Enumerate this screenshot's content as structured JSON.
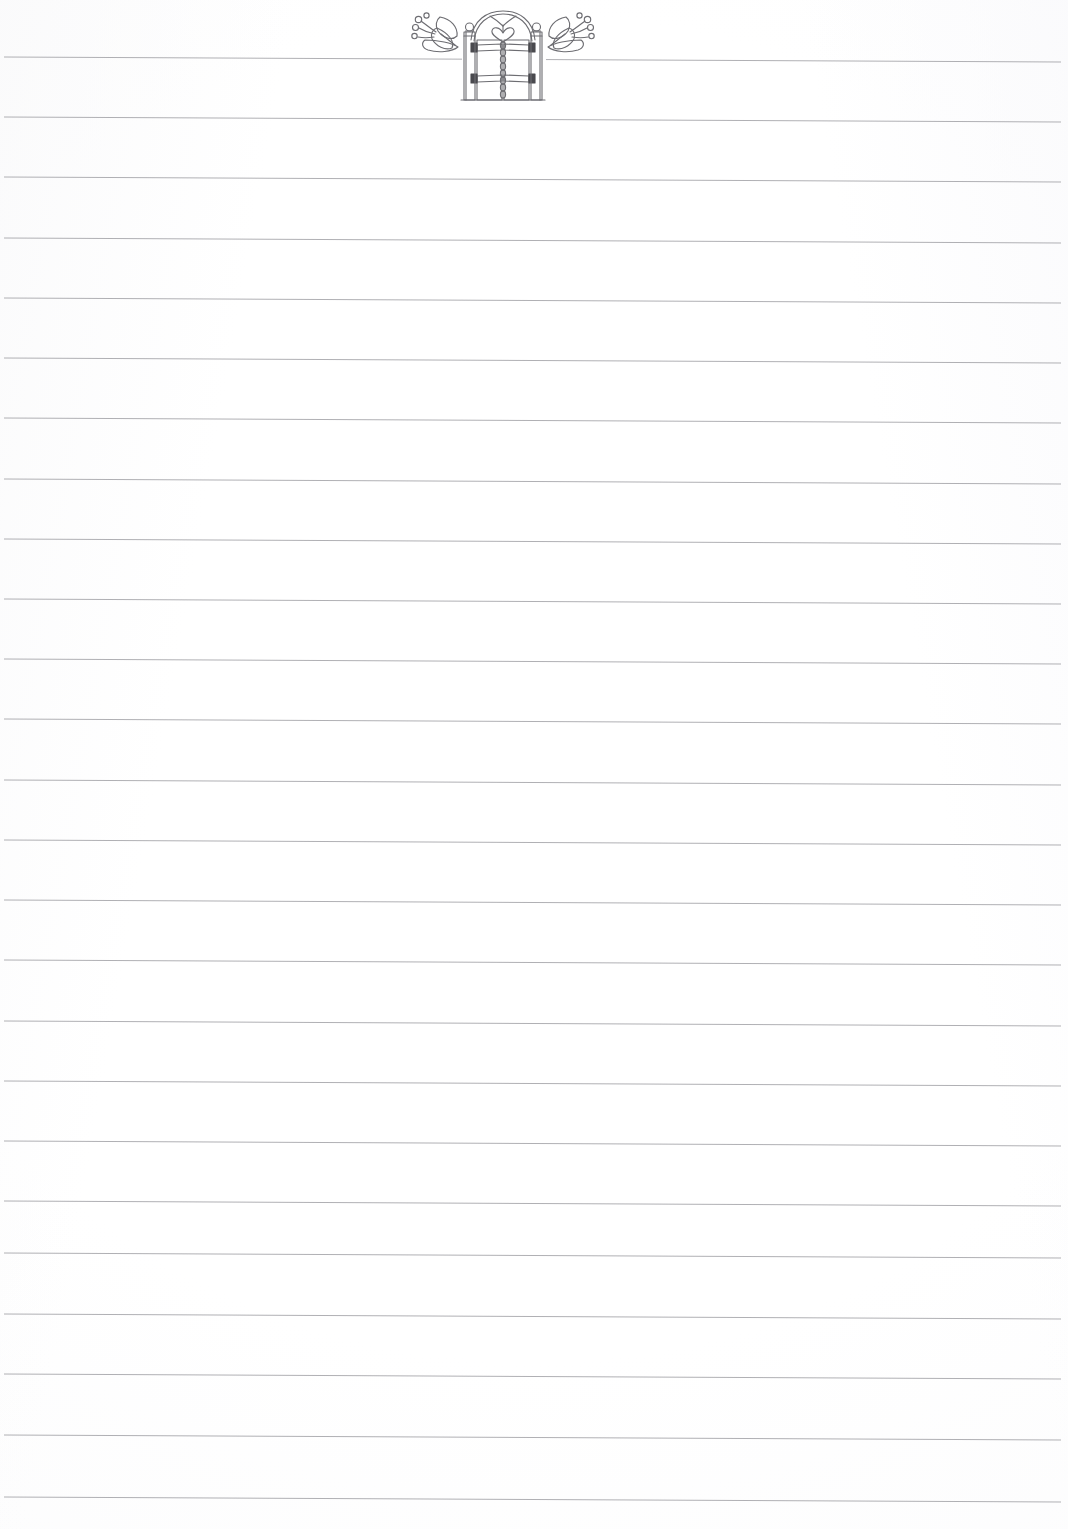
{
  "page": {
    "kind": "lined-notepaper-sheet",
    "width_px": 1068,
    "height_px": 1529,
    "background_color": "#fefefe",
    "paper_tint": "#fbfbfc",
    "content_text": "",
    "written_content": "",
    "notes_written": ""
  },
  "rules": {
    "label": "ruled writing lines",
    "line_color": "#9a9a9f",
    "line_width_px": 1,
    "count": 25,
    "first_line_y": 57,
    "spacing_y": 60.2,
    "left_margin_x": 4,
    "right_margin_x": 1061,
    "slope_drop_px": 5,
    "interrupted_first_line": true,
    "gap_start_x": 462,
    "gap_end_x": 546,
    "line_y_positions": [
      57,
      117,
      177,
      238,
      298,
      358,
      418,
      479,
      539,
      599,
      659,
      719,
      780,
      840,
      900,
      960,
      1021,
      1081,
      1141,
      1201,
      1253,
      1314,
      1374,
      1435,
      1497
    ]
  },
  "ornament": {
    "label": "garden gate with floral sprays",
    "stroke_color": "#6d6d72",
    "accent_color": "#4a4a4f",
    "center_x": 503,
    "gate": {
      "label": "wrought iron garden gate",
      "left_post_x": 465,
      "right_post_x": 540,
      "post_width": 12,
      "post_top_y": 30,
      "post_bottom_y": 100,
      "finial_label": "ball finial",
      "arch_label": "arched gate top",
      "heart_label": "heart scroll motif",
      "spine_label": "twisted beaded vertical bar",
      "rail_count": 2,
      "rail_upper_y": 47,
      "rail_lower_y": 78
    },
    "left_spray": {
      "label": "floral spray with berries and leaves",
      "berry_count": 4,
      "leaf_count": 3
    },
    "right_spray": {
      "label": "floral spray with berries and leaves",
      "berry_count": 4,
      "leaf_count": 3
    }
  }
}
